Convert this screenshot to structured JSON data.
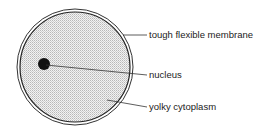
{
  "diagram": {
    "title": "",
    "labels": [
      {
        "id": "membrane",
        "text": "tough flexible membrane"
      },
      {
        "id": "nucleus",
        "text": "nucleus"
      },
      {
        "id": "cytoplasm",
        "text": "yolky cytoplasm"
      }
    ],
    "colors": {
      "stroke": "#222222",
      "fill_stipple": "#d9d9d9",
      "nucleus": "#111111"
    }
  }
}
